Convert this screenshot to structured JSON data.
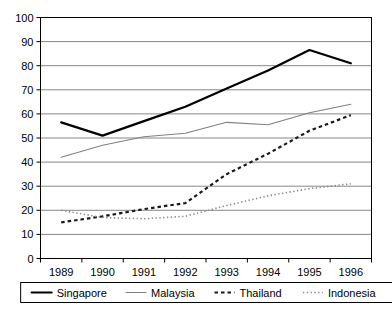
{
  "chart_data": {
    "type": "line",
    "title": "",
    "subtitle": "",
    "xlabel": "",
    "ylabel": "",
    "categories": [
      "1989",
      "1990",
      "1991",
      "1992",
      "1993",
      "1994",
      "1995",
      "1996"
    ],
    "x": [
      1989,
      1990,
      1991,
      1992,
      1993,
      1994,
      1995,
      1996
    ],
    "ylim": [
      0,
      100
    ],
    "yticks": [
      0,
      10,
      20,
      30,
      40,
      50,
      60,
      70,
      80,
      90,
      100
    ],
    "ytick_labels": [
      "0",
      "10",
      "20",
      "30",
      "40",
      "50",
      "60",
      "70",
      "80",
      "90",
      "100"
    ],
    "grid": "horizontal",
    "legend_position": "bottom",
    "series": [
      {
        "name": "Singapore",
        "values": [
          56.5,
          51,
          57,
          63,
          70.5,
          78,
          86.5,
          81
        ],
        "style": "solid",
        "color": "#000000",
        "width": 2.2
      },
      {
        "name": "Malaysia",
        "values": [
          42,
          47,
          50.5,
          52,
          56.5,
          55.5,
          60.5,
          64
        ],
        "style": "solid",
        "color": "#808080",
        "width": 1.1
      },
      {
        "name": "Thailand",
        "values": [
          15,
          17.5,
          20.5,
          23,
          35,
          43.5,
          53,
          59.5
        ],
        "style": "dashed",
        "color": "#1a1a1a",
        "width": 2.2
      },
      {
        "name": "Indonesia",
        "values": [
          20,
          17,
          16.5,
          17.5,
          22,
          26,
          29,
          31
        ],
        "style": "dotted",
        "color": "#8c8c8c",
        "width": 1.6
      }
    ]
  },
  "legend": {
    "items": [
      {
        "label": "Singapore"
      },
      {
        "label": "Malaysia"
      },
      {
        "label": "Thailand"
      },
      {
        "label": "Indonesia"
      }
    ]
  },
  "axes": {
    "y_labels": [
      "100",
      "90",
      "80",
      "70",
      "60",
      "50",
      "40",
      "30",
      "20",
      "10",
      "0"
    ],
    "x_labels": [
      "1989",
      "1990",
      "1991",
      "1992",
      "1993",
      "1994",
      "1995",
      "1996"
    ]
  },
  "colors": {
    "background": "#ffffff",
    "axis": "#000000",
    "gridline": "#878787",
    "singapore": "#000000",
    "malaysia": "#808080",
    "thailand": "#1a1a1a",
    "indonesia": "#8c8c8c"
  }
}
